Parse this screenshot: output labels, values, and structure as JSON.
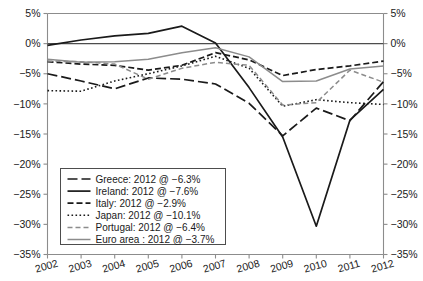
{
  "chart_data": {
    "type": "line",
    "title": "",
    "subtitle": "",
    "xlabel": "",
    "ylabel": "",
    "x": [
      2002,
      2003,
      2004,
      2005,
      2006,
      2007,
      2008,
      2009,
      2010,
      2011,
      2012
    ],
    "categories": [
      "2002",
      "2003",
      "2004",
      "2005",
      "2006",
      "2007",
      "2008",
      "2009",
      "2010",
      "2011",
      "2012"
    ],
    "ylim": [
      -35,
      5
    ],
    "ytick_values": [
      5,
      0,
      -5,
      -10,
      -15,
      -20,
      -25,
      -30,
      -35
    ],
    "ytick_labels": [
      "5%",
      "0%",
      "−5%",
      "−10%",
      "−15%",
      "−20%",
      "−25%",
      "−30%",
      "−35%"
    ],
    "xtick_labels": [
      "2002",
      "2003",
      "2004",
      "2005",
      "2006",
      "2007",
      "2008",
      "2009",
      "2010",
      "2011",
      "2012"
    ],
    "grid": false,
    "dual_y_axis": true,
    "legend_position": "lower-left",
    "y_unit": "%",
    "series": [
      {
        "name": "Greece",
        "legend_label": "Greece: 2012 @ −6.3%",
        "end_value": -6.3,
        "dash": "long-dash",
        "color": "#1a1a1a",
        "width": 1.7,
        "values": [
          -5.0,
          -6.2,
          -7.5,
          -5.7,
          -5.9,
          -6.7,
          -9.9,
          -15.3,
          -10.7,
          -12.8,
          -6.3
        ]
      },
      {
        "name": "Ireland",
        "legend_label": "Ireland: 2012 @ −7.6%",
        "end_value": -7.6,
        "dash": "solid",
        "color": "#1a1a1a",
        "width": 1.7,
        "values": [
          -0.3,
          0.6,
          1.3,
          1.7,
          2.9,
          0.1,
          -7.3,
          -15.5,
          -30.3,
          -12.7,
          -7.6
        ]
      },
      {
        "name": "Italy",
        "legend_label": "Italy: 2012 @ −2.9%",
        "end_value": -2.9,
        "dash": "dash",
        "color": "#1a1a1a",
        "width": 1.7,
        "values": [
          -3.0,
          -3.4,
          -3.6,
          -4.4,
          -3.6,
          -1.5,
          -2.7,
          -5.3,
          -4.3,
          -3.7,
          -2.9
        ]
      },
      {
        "name": "Japan",
        "legend_label": "Japan: 2012 @ −10.1%",
        "end_value": -10.1,
        "dash": "dot",
        "color": "#1a1a1a",
        "width": 1.6,
        "values": [
          -7.8,
          -7.9,
          -6.2,
          -5.0,
          -3.7,
          -2.1,
          -4.1,
          -10.4,
          -9.3,
          -9.8,
          -10.1
        ]
      },
      {
        "name": "Portugal",
        "legend_label": "Portugal: 2012 @ −6.4%",
        "end_value": -6.4,
        "dash": "dash-light",
        "color": "#8c8c8c",
        "width": 1.5,
        "values": [
          -2.9,
          -3.0,
          -3.4,
          -5.9,
          -4.1,
          -3.1,
          -3.6,
          -10.2,
          -9.8,
          -4.4,
          -6.4
        ]
      },
      {
        "name": "Euro area",
        "legend_label": "Euro area : 2012 @ −3.7%",
        "end_value": -3.7,
        "dash": "solid-light",
        "color": "#8c8c8c",
        "width": 1.5,
        "values": [
          -2.6,
          -3.1,
          -3.0,
          -2.6,
          -1.5,
          -0.7,
          -2.2,
          -6.3,
          -6.2,
          -4.2,
          -3.7
        ]
      }
    ]
  },
  "legend": {
    "items": [
      {
        "label": "Greece: 2012 @ −6.3%"
      },
      {
        "label": "Ireland: 2012 @ −7.6%"
      },
      {
        "label": "Italy: 2012 @ −2.9%"
      },
      {
        "label": "Japan: 2012 @ −10.1%"
      },
      {
        "label": "Portugal: 2012 @ −6.4%"
      },
      {
        "label": "Euro area : 2012 @ −3.7%"
      }
    ]
  },
  "colors": {
    "dark": "#1a1a1a",
    "light": "#8c8c8c",
    "axis": "#8c8c8c",
    "background": "#ffffff"
  }
}
